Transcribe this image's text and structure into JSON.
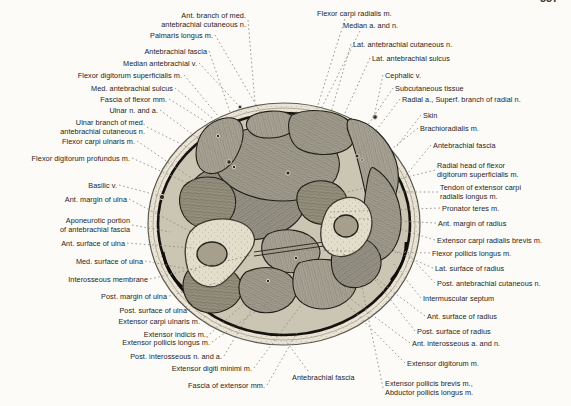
{
  "page": {
    "number": "337"
  },
  "colors": {
    "paper": "#fcfbf7",
    "ink": "#26241f",
    "leader_dash": "#8b8880",
    "fascia_line": "#15130e",
    "muscle_gray": "#a19d8e",
    "bone_light": "#e2ddcb",
    "marrow_gray": "#a69f8d"
  },
  "figure": {
    "type": "anatomical-cross-section-diagram",
    "labels": [
      {
        "text": "Ant. branch of med.\nantebrachial cutaneous n.",
        "side": "left",
        "x": 246,
        "y": 20,
        "t": [
          255,
          103
        ]
      },
      {
        "text": "Palmaris longus m.",
        "side": "left",
        "x": 213,
        "y": 35,
        "t": [
          265,
          120
        ]
      },
      {
        "text": "Antebrachial fascia",
        "side": "left",
        "x": 207,
        "y": 51,
        "t": [
          230,
          112
        ]
      },
      {
        "text": "Median antebrachial v.",
        "side": "left",
        "x": 197,
        "y": 63,
        "t": [
          239,
          106
        ]
      },
      {
        "text": "Flexor digitorum superficialis m.",
        "side": "left",
        "x": 182,
        "y": 75,
        "t": [
          255,
          160
        ]
      },
      {
        "text": "Med. antebrachial sulcus",
        "side": "left",
        "x": 173,
        "y": 88,
        "t": [
          217,
          122
        ]
      },
      {
        "text": "Fascia of flexor mm.",
        "side": "left",
        "x": 167,
        "y": 99,
        "t": [
          227,
          135
        ]
      },
      {
        "text": "Ulnar n. and a.",
        "side": "left",
        "x": 158,
        "y": 110,
        "t": [
          229,
          162
        ]
      },
      {
        "text": "Ulnar branch of med.\nantebrachial cutaneous n.",
        "side": "left",
        "x": 145,
        "y": 127,
        "t": [
          193,
          150
        ]
      },
      {
        "text": "Flexor carpi ulnaris m.",
        "side": "left",
        "x": 135,
        "y": 141,
        "t": [
          206,
          188
        ]
      },
      {
        "text": "Flexor digitorum profundus m.",
        "side": "left",
        "x": 130,
        "y": 158,
        "t": [
          242,
          208
        ]
      },
      {
        "text": "Basilic v.",
        "side": "left",
        "x": 117,
        "y": 185,
        "t": [
          160,
          196
        ]
      },
      {
        "text": "Ant. margin of ulna",
        "side": "left",
        "x": 127,
        "y": 199,
        "t": [
          193,
          233
        ]
      },
      {
        "text": "Aponeurotic portion\nof antebrachial fascia",
        "side": "left",
        "x": 130,
        "y": 225,
        "t": [
          170,
          232
        ]
      },
      {
        "text": "Ant. surface of ulna",
        "side": "left",
        "x": 125,
        "y": 243,
        "t": [
          193,
          248
        ]
      },
      {
        "text": "Med. surface of ulna",
        "side": "left",
        "x": 143,
        "y": 261,
        "t": [
          199,
          271
        ]
      },
      {
        "text": "Interosseous membrane",
        "side": "left",
        "x": 148,
        "y": 279,
        "t": [
          252,
          255
        ]
      },
      {
        "text": "Post. margin of ulna",
        "side": "left",
        "x": 167,
        "y": 296,
        "t": [
          216,
          283
        ]
      },
      {
        "text": "Post. surface of ulna",
        "side": "left",
        "x": 187,
        "y": 310,
        "t": [
          228,
          276
        ]
      },
      {
        "text": "Extensor carpi ulnaris m.",
        "side": "left",
        "x": 200,
        "y": 321,
        "t": [
          218,
          296
        ]
      },
      {
        "text": "Extensor indicis m.,",
        "side": "left",
        "x": 208,
        "y": 334,
        "t": [
          256,
          293
        ]
      },
      {
        "text": "Extensor pollicis longus m.",
        "side": "left",
        "x": 210,
        "y": 342,
        "t": [
          272,
          300
        ]
      },
      {
        "text": "Post. interosseous n. and a.",
        "side": "left",
        "x": 222,
        "y": 356,
        "t": [
          268,
          282
        ]
      },
      {
        "text": "Extensor digiti minimi m.",
        "side": "left",
        "x": 252,
        "y": 368,
        "t": [
          305,
          300
        ]
      },
      {
        "text": "Fascia of extensor mm.",
        "side": "left",
        "x": 265,
        "y": 385,
        "t": [
          298,
          331
        ]
      },
      {
        "text": "Flexor carpi radialis m.",
        "side": "right",
        "x": 317,
        "y": 13,
        "s": [
          345,
          19
        ],
        "t": [
          310,
          130
        ]
      },
      {
        "text": "Median a. and n.",
        "side": "right",
        "x": 343,
        "y": 25,
        "s": [
          360,
          31
        ],
        "t": [
          290,
          171
        ]
      },
      {
        "text": "Lat. antebrachial cutaneous n.",
        "side": "right",
        "x": 353,
        "y": 44,
        "t": [
          330,
          116
        ]
      },
      {
        "text": "Lat. antebrachial sulcus",
        "side": "right",
        "x": 372,
        "y": 58,
        "t": [
          340,
          124
        ]
      },
      {
        "text": "Cephalic v.",
        "side": "right",
        "x": 385,
        "y": 75,
        "t": [
          374,
          117
        ]
      },
      {
        "text": "Subcutaneous tissue",
        "side": "right",
        "x": 395,
        "y": 88,
        "t": [
          366,
          128
        ]
      },
      {
        "text": "Radial a., Superf. branch of radial n.",
        "side": "right",
        "x": 402,
        "y": 99,
        "t": [
          358,
          154
        ]
      },
      {
        "text": "Skin",
        "side": "right",
        "x": 423,
        "y": 115,
        "t": [
          397,
          146
        ]
      },
      {
        "text": "Brachioradialis m.",
        "side": "right",
        "x": 420,
        "y": 128,
        "t": [
          378,
          160
        ]
      },
      {
        "text": "Antebrachial fascia",
        "side": "right",
        "x": 433,
        "y": 145,
        "t": [
          402,
          180
        ]
      },
      {
        "text": "Radial head of flexor\ndigitorum superficialis m.",
        "side": "right",
        "x": 437,
        "y": 170,
        "t": [
          332,
          196
        ]
      },
      {
        "text": "Tendon of extensor carpi\nradialis longus m.",
        "side": "right",
        "x": 440,
        "y": 192,
        "t": [
          390,
          192
        ]
      },
      {
        "text": "Pronator teres m.",
        "side": "right",
        "x": 442,
        "y": 208,
        "t": [
          330,
          212
        ]
      },
      {
        "text": "Ant. margin of radius",
        "side": "right",
        "x": 438,
        "y": 223,
        "t": [
          327,
          217
        ]
      },
      {
        "text": "Extensor carpi radialis brevis m.",
        "side": "right",
        "x": 437,
        "y": 240,
        "t": [
          390,
          226
        ]
      },
      {
        "text": "Flexor pollicis longus m.",
        "side": "right",
        "x": 432,
        "y": 253,
        "t": [
          300,
          250
        ]
      },
      {
        "text": "Lat. surface of radius",
        "side": "right",
        "x": 435,
        "y": 268,
        "t": [
          369,
          240
        ]
      },
      {
        "text": "Post. antebrachial cutaneous n.",
        "side": "right",
        "x": 437,
        "y": 283,
        "t": [
          405,
          251
        ]
      },
      {
        "text": "Intermuscular septum",
        "side": "right",
        "x": 423,
        "y": 298,
        "t": [
          393,
          263
        ]
      },
      {
        "text": "Ant. surface of radius",
        "side": "right",
        "x": 427,
        "y": 316,
        "t": [
          336,
          248
        ]
      },
      {
        "text": "Post. surface of radius",
        "side": "right",
        "x": 417,
        "y": 331,
        "t": [
          358,
          258
        ]
      },
      {
        "text": "Ant. interosseous a. and n.",
        "side": "right",
        "x": 412,
        "y": 343,
        "t": [
          297,
          259
        ]
      },
      {
        "text": "Extensor digitorum m.",
        "side": "right",
        "x": 407,
        "y": 363,
        "t": [
          340,
          297
        ]
      },
      {
        "text": "Extensor pollicis brevis m.,\nAbductor pollicis longus m.",
        "side": "right",
        "x": 385,
        "y": 388,
        "t": [
          362,
          287
        ]
      },
      {
        "text": "Antebrachial fascia",
        "side": "right",
        "x": 292,
        "y": 377,
        "s": [
          308,
          371
        ],
        "t": [
          286,
          341
        ]
      }
    ]
  }
}
